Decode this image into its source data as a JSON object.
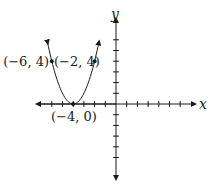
{
  "chart_data": {
    "type": "line",
    "title": "",
    "function": "y = (x + 4)^2",
    "xlabel": "x",
    "ylabel": "y",
    "xlim": [
      -7,
      7
    ],
    "ylim": [
      -6,
      6
    ],
    "grid": false,
    "tick_spacing": 1,
    "x_ticks": [
      -6,
      -5,
      -4,
      -3,
      -2,
      -1,
      1,
      2,
      3,
      4,
      5,
      6
    ],
    "y_ticks": [
      -5,
      -4,
      -3,
      -2,
      -1,
      1,
      2,
      3,
      4,
      5,
      6
    ],
    "series": [
      {
        "name": "parabola",
        "x": [
          -6.4,
          -6,
          -5,
          -4,
          -3,
          -2,
          -1.6
        ],
        "y": [
          5.76,
          4,
          1,
          0,
          1,
          4,
          5.76
        ]
      }
    ],
    "points": [
      {
        "x": -6,
        "y": 4,
        "label": "(−6, 4)"
      },
      {
        "x": -2,
        "y": 4,
        "label": "(−2, 4)"
      },
      {
        "x": -4,
        "y": 0,
        "label": "(−4, 0)"
      }
    ]
  },
  "labels": {
    "x_axis": "x",
    "y_axis": "y",
    "point_left": "(−6, 4)",
    "point_right": "(−2, 4)",
    "vertex": "(−4, 0)"
  },
  "colors": {
    "ink": "#1a1a1a",
    "background": "#ffffff"
  }
}
